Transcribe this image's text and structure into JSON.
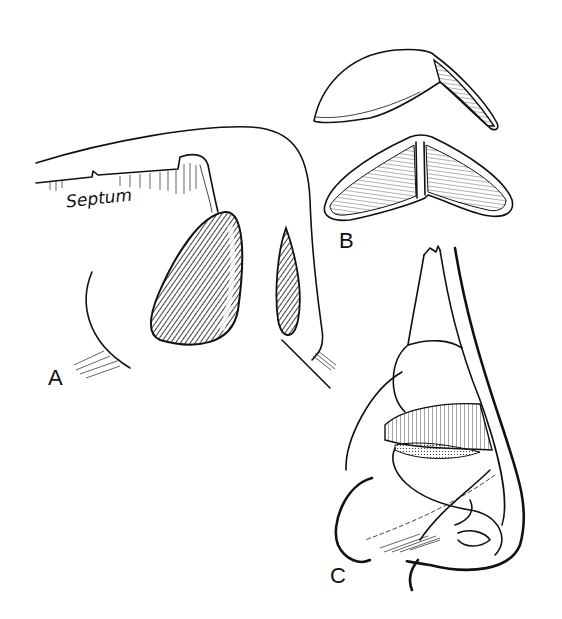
{
  "figure": {
    "panels": [
      {
        "id": "A",
        "label": "A",
        "annotation": "Septum",
        "subject": "Sagittal view of nasal cavity with septum and two hatched cartilages"
      },
      {
        "id": "B",
        "label": "B",
        "subject": "Two views of a V-shaped (boomerang) cartilage graft"
      },
      {
        "id": "C",
        "label": "C",
        "subject": "Lateral view of nose with hatched cartilage and dashed incision line"
      }
    ]
  },
  "colors": {
    "ink": "#111111",
    "background": "#ffffff"
  }
}
